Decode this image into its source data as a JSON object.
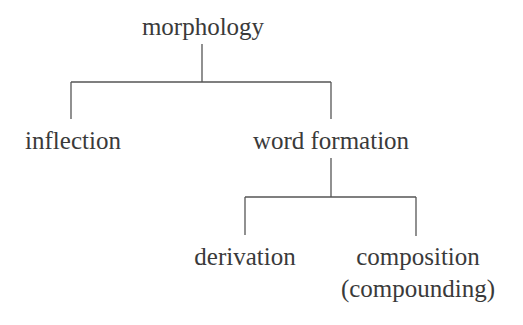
{
  "tree": {
    "root": "morphology",
    "level1": {
      "left": "inflection",
      "right": "word formation"
    },
    "level2": {
      "left": "derivation",
      "right_line1": "composition",
      "right_line2": "(compounding)"
    }
  },
  "colors": {
    "line": "#555555",
    "text": "#3a3a3a"
  }
}
